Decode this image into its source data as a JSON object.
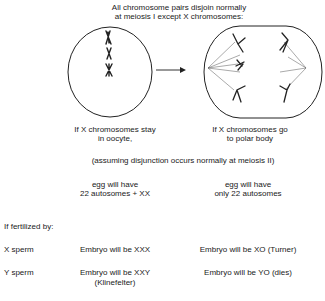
{
  "title": {
    "line1": "All chromosome pairs disjoin normally",
    "line2": "at meiosis I except X chromosomes:"
  },
  "diagram": {
    "left_cell": "cell-with-aligned-chromosomes",
    "arrow": "right-arrow",
    "right_cell": "cell-in-anaphase-I"
  },
  "scenarios": {
    "left_caption": {
      "line1": "If X chromosomes stay",
      "line2": "in oocyte,"
    },
    "right_caption": {
      "line1": "If X chromosomes go",
      "line2": "to polar body"
    },
    "assumption": "(assuming disjunction occurs normally at meiosis II)",
    "left_egg": {
      "line1": "egg will have",
      "line2": "22 autosomes + XX"
    },
    "right_egg": {
      "line1": "egg will have",
      "line2": "only 22 autosomes"
    }
  },
  "fertilization": {
    "heading": "If fertilized by:",
    "rows": [
      {
        "sperm": "X sperm",
        "left": "Embryo will be XXX",
        "left_note": "",
        "right": "Embryo will be XO (Turner)"
      },
      {
        "sperm": "Y sperm",
        "left": "Embryo will be XXY",
        "left_note": "(Klinefelter)",
        "right": "Embryo will be YO (dies)"
      }
    ]
  }
}
